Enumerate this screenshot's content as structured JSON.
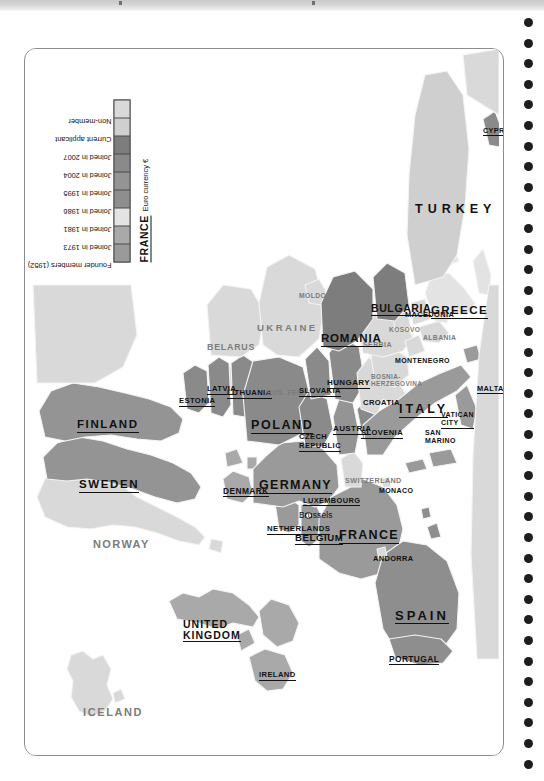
{
  "page": {
    "kind": "scanned-atlas-page",
    "title_strip_visible": true
  },
  "legend": {
    "title_absent": true,
    "items": [
      {
        "label": "Founder members (1952)",
        "color": "#9a9a9a"
      },
      {
        "label": "Joined in 1973",
        "color": "#a9a9a9"
      },
      {
        "label": "Joined in 1981",
        "color": "#e3e3e3"
      },
      {
        "label": "Joined in 1986",
        "color": "#8e8e8e"
      },
      {
        "label": "Joined in 1995",
        "color": "#949494"
      },
      {
        "label": "Joined in 2004",
        "color": "#8a8a8a"
      },
      {
        "label": "Joined in 2007",
        "color": "#7d7d7d"
      },
      {
        "label": "Current applicant",
        "color": "#cfcfcf"
      },
      {
        "label": "Non-member",
        "color": "#d9d9d9"
      }
    ],
    "euro_note": {
      "country": "FRANCE",
      "description": "Euro currency €"
    }
  },
  "map": {
    "projection_note": "Europe political map, EU membership shading",
    "colors": {
      "founder": "#9a9a9a",
      "j1973": "#a9a9a9",
      "j1981": "#e3e3e3",
      "j1986": "#8e8e8e",
      "j1995": "#949494",
      "j2004": "#8a8a8a",
      "j2007": "#7d7d7d",
      "applicant": "#cfcfcf",
      "nonmember": "#d9d9d9",
      "sea": "#ffffff",
      "border": "#f2f2f2",
      "outline": "#bdbdbd"
    },
    "labels": [
      {
        "name": "ICELAND",
        "status": "non-member",
        "style": "gray"
      },
      {
        "name": "NORWAY",
        "status": "non-member",
        "style": "gray"
      },
      {
        "name": "SWEDEN",
        "status": "joined-1995",
        "style": "underline"
      },
      {
        "name": "FINLAND",
        "status": "joined-1995",
        "style": "underline"
      },
      {
        "name": "ESTONIA",
        "status": "joined-2004",
        "style": "underline"
      },
      {
        "name": "LATVIA",
        "status": "joined-2004",
        "style": "underline"
      },
      {
        "name": "LITHUANIA",
        "status": "joined-2004",
        "style": "underline"
      },
      {
        "name": "RUS. FED.",
        "status": "non-member",
        "style": "gray"
      },
      {
        "name": "BELARUS",
        "status": "non-member",
        "style": "gray"
      },
      {
        "name": "UKRAINE",
        "status": "non-member",
        "style": "gray"
      },
      {
        "name": "MOLDOVA",
        "status": "non-member",
        "style": "gray"
      },
      {
        "name": "DENMARK",
        "status": "joined-1973",
        "style": "underline"
      },
      {
        "name": "UNITED KINGDOM",
        "status": "joined-1973",
        "style": "underline"
      },
      {
        "name": "IRELAND",
        "status": "joined-1973",
        "style": "underline"
      },
      {
        "name": "NETHERLANDS",
        "status": "founder",
        "style": "underline"
      },
      {
        "name": "BELGIUM",
        "status": "founder",
        "style": "underline"
      },
      {
        "name": "LUXEMBOURG",
        "status": "founder",
        "style": "underline"
      },
      {
        "name": "GERMANY",
        "status": "founder",
        "style": "underline"
      },
      {
        "name": "FRANCE",
        "status": "founder",
        "style": "underline"
      },
      {
        "name": "POLAND",
        "status": "joined-2004",
        "style": "underline"
      },
      {
        "name": "CZECH REPUBLIC",
        "status": "joined-2004",
        "style": "underline"
      },
      {
        "name": "SLOVAKIA",
        "status": "joined-2004",
        "style": "underline"
      },
      {
        "name": "AUSTRIA",
        "status": "joined-1995",
        "style": "underline"
      },
      {
        "name": "HUNGARY",
        "status": "joined-2004",
        "style": "underline"
      },
      {
        "name": "SLOVENIA",
        "status": "joined-2004",
        "style": "underline"
      },
      {
        "name": "SWITZERLAND",
        "status": "non-member",
        "style": "gray"
      },
      {
        "name": "CROATIA",
        "status": "non-member",
        "style": "plain"
      },
      {
        "name": "BOSNIA-HERZEGOVINA",
        "status": "non-member",
        "style": "gray"
      },
      {
        "name": "SERBIA",
        "status": "non-member",
        "style": "gray"
      },
      {
        "name": "MONTENEGRO",
        "status": "non-member",
        "style": "plain"
      },
      {
        "name": "KOSOVO",
        "status": "non-member",
        "style": "gray"
      },
      {
        "name": "MACEDONIA",
        "status": "non-member",
        "style": "plain"
      },
      {
        "name": "ALBANIA",
        "status": "non-member",
        "style": "gray"
      },
      {
        "name": "ROMANIA",
        "status": "joined-2007",
        "style": "underline"
      },
      {
        "name": "BULGARIA",
        "status": "joined-2007",
        "style": "underline"
      },
      {
        "name": "GREECE",
        "status": "joined-1981",
        "style": "underline"
      },
      {
        "name": "TURKEY",
        "status": "applicant",
        "style": "plain"
      },
      {
        "name": "CYPRUS",
        "status": "joined-2004",
        "style": "underline"
      },
      {
        "name": "ITALY",
        "status": "founder",
        "style": "underline"
      },
      {
        "name": "SAN MARINO",
        "status": "non-member",
        "style": "plain"
      },
      {
        "name": "VATICAN CITY",
        "status": "non-member",
        "style": "underline"
      },
      {
        "name": "MALTA",
        "status": "joined-2004",
        "style": "underline"
      },
      {
        "name": "MONACO",
        "status": "non-member",
        "style": "plain"
      },
      {
        "name": "ANDORRA",
        "status": "non-member",
        "style": "plain"
      },
      {
        "name": "SPAIN",
        "status": "joined-1986",
        "style": "underline"
      },
      {
        "name": "PORTUGAL",
        "status": "joined-1986",
        "style": "underline"
      }
    ],
    "capital": {
      "name": "Brussels",
      "marker": "capital-dot"
    }
  }
}
